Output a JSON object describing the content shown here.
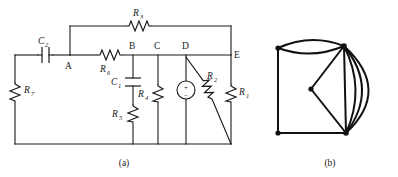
{
  "figure": {
    "panels": [
      {
        "id": "a",
        "caption": "(a)",
        "description": "circuit schematic"
      },
      {
        "id": "b",
        "caption": "(b)",
        "description": "linear graph of the network"
      }
    ]
  },
  "circuit": {
    "nodes": [
      {
        "id": "A",
        "label": "A"
      },
      {
        "id": "B",
        "label": "B"
      },
      {
        "id": "C",
        "label": "C"
      },
      {
        "id": "D",
        "label": "D"
      },
      {
        "id": "E",
        "label": "E"
      }
    ],
    "components": [
      {
        "id": "R1",
        "sym": "R",
        "sub": "1",
        "type": "resistor"
      },
      {
        "id": "R2",
        "sym": "R",
        "sub": "2",
        "type": "resistor"
      },
      {
        "id": "R3",
        "sym": "R",
        "sub": "3",
        "type": "resistor"
      },
      {
        "id": "R4",
        "sym": "R",
        "sub": "4",
        "type": "resistor"
      },
      {
        "id": "R5",
        "sym": "R",
        "sub": "5",
        "type": "resistor"
      },
      {
        "id": "R6",
        "sym": "R",
        "sub": "6",
        "type": "resistor"
      },
      {
        "id": "R7",
        "sym": "R",
        "sub": "7",
        "type": "resistor"
      },
      {
        "id": "C1",
        "sym": "C",
        "sub": "1",
        "type": "capacitor"
      },
      {
        "id": "C2",
        "sym": "C",
        "sub": "2",
        "type": "capacitor"
      },
      {
        "id": "VS",
        "sym": "",
        "sub": "",
        "type": "voltage-source",
        "plus": "+",
        "minus": "−"
      }
    ]
  },
  "graph": {
    "vertices": [
      {
        "id": "v1",
        "x": 278,
        "y": 48
      },
      {
        "id": "v2",
        "x": 344,
        "y": 46
      },
      {
        "id": "v3",
        "x": 311,
        "y": 89
      },
      {
        "id": "v4",
        "x": 278,
        "y": 133
      },
      {
        "id": "v5",
        "x": 346,
        "y": 133
      }
    ],
    "edge_count_multi": 4
  }
}
